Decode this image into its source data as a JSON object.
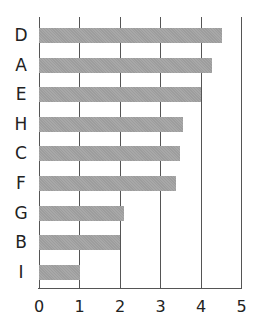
{
  "chart_data": {
    "type": "bar",
    "orientation": "horizontal",
    "title": "",
    "xlabel": "",
    "ylabel": "",
    "categories": [
      "D",
      "A",
      "E",
      "H",
      "C",
      "F",
      "G",
      "B",
      "I"
    ],
    "values": [
      4.53,
      4.28,
      4.0,
      3.55,
      3.48,
      3.38,
      2.1,
      2.0,
      1.0
    ],
    "xlim": [
      0,
      5
    ],
    "xticks": [
      "0",
      "1",
      "2",
      "3",
      "4",
      "5"
    ],
    "grid": true,
    "bar_color": "#a3a3a3",
    "gridline_color": "#555555"
  }
}
